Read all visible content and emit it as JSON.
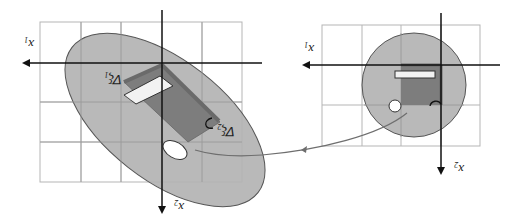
{
  "diagram": {
    "title": "",
    "orientation": "rotated 180 degrees",
    "colors": {
      "grid": "#b5b5b5",
      "axis": "#111111",
      "region_fill": "#b3b3b3",
      "region_stroke": "#555555",
      "dark_patch": "#7d7d7d",
      "mapping_curve": "#6e6e6e"
    },
    "left_panel": {
      "name": "deformed configuration",
      "axis_horizontal_label": "x",
      "axis_horizontal_sub": "1",
      "axis_vertical_label": "x",
      "axis_vertical_sub": "2",
      "vector_1_label": "∇ξ",
      "vector_1_sub": "1",
      "vector_2_label": "∇ξ",
      "vector_2_sub": "2",
      "region_shape": "ellipse"
    },
    "right_panel": {
      "name": "reference configuration",
      "axis_horizontal_label": "x",
      "axis_horizontal_sub": "1",
      "axis_vertical_label": "x",
      "axis_vertical_sub": "2",
      "region_shape": "circle"
    },
    "mapping_arrow": "curve from right circle to left ellipse"
  }
}
